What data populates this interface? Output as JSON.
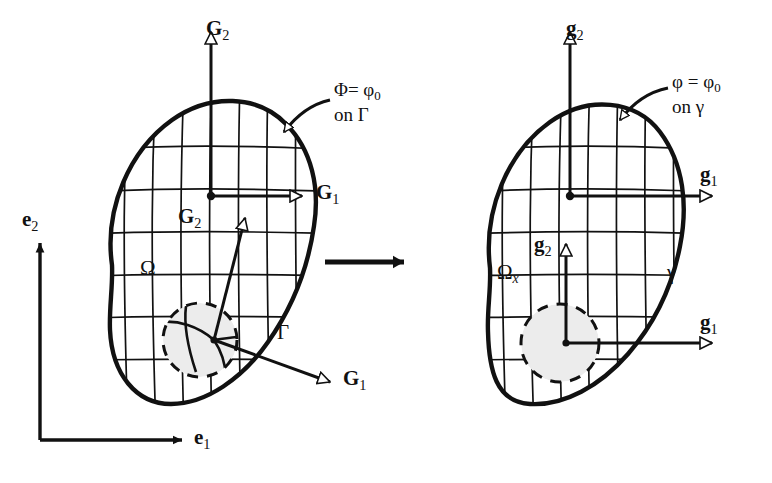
{
  "figure": {
    "type": "diagram",
    "background_color": "#ffffff",
    "ink_color": "#111111",
    "shading_color": "#e8e8e8"
  },
  "global_axes": {
    "name": "global-cartesian-basis",
    "e1_label": "e",
    "e1_sub": "1",
    "e2_label": "e",
    "e2_sub": "2",
    "arrow_style": "solid-filled"
  },
  "transform_arrow": {
    "name": "transformation-arrow",
    "style": "solid-filled",
    "direction": "right"
  },
  "reference": {
    "name": "reference-configuration",
    "domain_label": "Ω",
    "boundary_label": "Γ",
    "boundary_condition": {
      "lhs": "Φ=",
      "rhs": "φ",
      "rhs_sub": "0",
      "line2_prefix": "on",
      "line2_symbol": "Γ"
    },
    "basis_outer": {
      "g1_label": "G",
      "g1_sub": "1",
      "g2_label": "G",
      "g2_sub": "2",
      "arrow_style": "hollow"
    },
    "basis_inner": {
      "g1_label": "G",
      "g1_sub": "1",
      "g2_label": "G",
      "g2_sub": "2",
      "arrow_style": "hollow-diagonal"
    }
  },
  "current": {
    "name": "current-configuration",
    "domain_label": "Ω",
    "domain_sub": "x",
    "boundary_label": "γ",
    "boundary_condition": {
      "lhs": "φ =",
      "rhs": "φ",
      "rhs_sub": "0",
      "line2_prefix": "on",
      "line2_symbol": "γ"
    },
    "basis_outer": {
      "g1_label": "g",
      "g1_sub": "1",
      "g2_label": "g",
      "g2_sub": "2",
      "arrow_style": "hollow"
    },
    "basis_inner": {
      "g1_label": "g",
      "g1_sub": "1",
      "g2_label": "g",
      "g2_sub": "2",
      "arrow_style": "hollow"
    }
  }
}
